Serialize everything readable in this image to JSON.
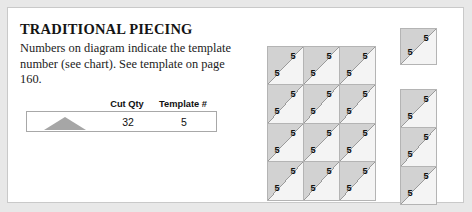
{
  "card": {
    "background": "#ffffff",
    "border_color": "#c9c9c9"
  },
  "panel": {
    "title": "TRADITIONAL PIECING",
    "description": "Numbers on diagram indicate the template number (see chart). See template on page 160."
  },
  "table": {
    "headers": {
      "shape": "",
      "cut_qty": "Cut Qty",
      "template_number": "Template #"
    },
    "rows": [
      {
        "shape_icon": "triangle-icon",
        "cut_qty": "32",
        "template_number": "5"
      }
    ]
  },
  "diagram": {
    "template_number": "5",
    "colors": {
      "upper_triangle": "#d2d2d2",
      "lower_triangle": "#f4f4f4",
      "diagonal_line": "#9a9a9a",
      "cell_border": "#b4b4b4"
    },
    "groups": [
      {
        "name": "main-grid",
        "columns": 3,
        "rows": 4,
        "cells": [
          {
            "upper_right": "5",
            "lower_left": "5"
          },
          {
            "upper_right": "5",
            "lower_left": "5"
          },
          {
            "upper_right": "5",
            "lower_left": "5"
          },
          {
            "upper_right": "5",
            "lower_left": "5"
          },
          {
            "upper_right": "5",
            "lower_left": "5"
          },
          {
            "upper_right": "5",
            "lower_left": "5"
          },
          {
            "upper_right": "5",
            "lower_left": "5"
          },
          {
            "upper_right": "5",
            "lower_left": "5"
          },
          {
            "upper_right": "5",
            "lower_left": "5"
          },
          {
            "upper_right": "5",
            "lower_left": "5"
          },
          {
            "upper_right": "5",
            "lower_left": "5"
          },
          {
            "upper_right": "5",
            "lower_left": "5"
          }
        ]
      },
      {
        "name": "single-block",
        "columns": 1,
        "rows": 1,
        "cells": [
          {
            "upper_right": "5",
            "lower_left": "5"
          }
        ]
      },
      {
        "name": "side-column",
        "columns": 1,
        "rows": 3,
        "cells": [
          {
            "upper_right": "5",
            "lower_left": "5"
          },
          {
            "upper_right": "5",
            "lower_left": "5"
          },
          {
            "upper_right": "5",
            "lower_left": "5"
          }
        ]
      }
    ]
  }
}
